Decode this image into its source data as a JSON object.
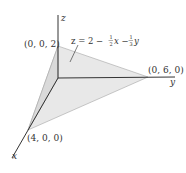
{
  "diagram": {
    "type": "3d-plane-tetrahedron",
    "colors": {
      "axis": "#333333",
      "plane_fill": "#e6e6e6",
      "plane_fill_dark": "#d6d6d6",
      "plane_edge": "#9a9a9a",
      "text": "#333333"
    },
    "axes": {
      "x_label": "x",
      "y_label": "y",
      "z_label": "z"
    },
    "points": [
      {
        "id": "z-intercept",
        "label": "(0, 0, 2)"
      },
      {
        "id": "y-intercept",
        "label": "(0, 6, 0)"
      },
      {
        "id": "x-intercept",
        "label": "(4, 0, 0)"
      }
    ],
    "equation": {
      "prefix": "z = 2 −",
      "frac1_num": "1",
      "frac1_den": "2",
      "mid": "x −",
      "frac2_num": "1",
      "frac2_den": "3",
      "suffix": "y"
    }
  }
}
